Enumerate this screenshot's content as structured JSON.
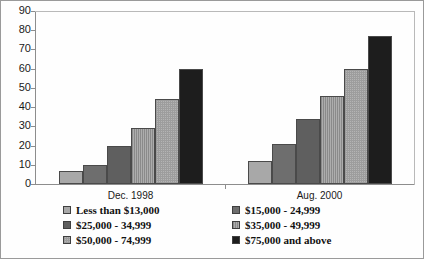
{
  "chart_data": {
    "type": "bar",
    "title": "",
    "subtitle": "",
    "xlabel": "",
    "ylabel": "",
    "ylim": [
      0,
      90
    ],
    "y_ticks": [
      0,
      10,
      20,
      30,
      40,
      50,
      60,
      70,
      80,
      90
    ],
    "grid": false,
    "legend_position": "bottom",
    "categories": [
      "Dec. 1998",
      "Aug. 2000"
    ],
    "series": [
      {
        "name": "Less than $13,000",
        "color": "#a8a8a8",
        "values": [
          7,
          12
        ]
      },
      {
        "name": "$15,000 - 24,999",
        "color": "#6e6e6e",
        "values": [
          10,
          21
        ]
      },
      {
        "name": "$25,000 - 34,999",
        "color": "#5f5f5f",
        "values": [
          20,
          34
        ]
      },
      {
        "name": "$35,000 - 49,999",
        "color": "#989898",
        "values": [
          29,
          46
        ]
      },
      {
        "name": "$50,000 - 74,999",
        "color": "#b4b4b4",
        "values": [
          44,
          60
        ]
      },
      {
        "name": "$75,000 and above",
        "color": "#1d1d1d",
        "values": [
          60,
          77
        ]
      }
    ]
  },
  "axis": {
    "y_tick_labels": [
      "90",
      "80",
      "70",
      "60",
      "50",
      "40",
      "30",
      "20",
      "10",
      "0"
    ]
  },
  "groups": [
    {
      "label": "Dec. 1998"
    },
    {
      "label": "Aug. 2000"
    }
  ],
  "legend": {
    "left_column": [
      {
        "label": "Less than $13,000",
        "swatch": "#a8a8a8"
      },
      {
        "label": "$25,000 - 34,999",
        "swatch": "#5f5f5f"
      },
      {
        "label": "$50,000 - 74,999",
        "swatch": "#b4b4b4"
      }
    ],
    "right_column": [
      {
        "label": "$15,000 - 24,999",
        "swatch": "#6e6e6e"
      },
      {
        "label": "$35,000 - 49,999",
        "swatch": "#989898"
      },
      {
        "label": "$75,000 and above",
        "swatch": "#1d1d1d"
      }
    ]
  }
}
